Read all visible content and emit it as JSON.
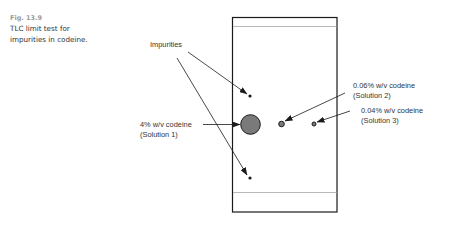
{
  "figure": {
    "number": "Fig. 13.9",
    "caption_lines": [
      "TLC limit test for",
      "impurities in codeine."
    ]
  },
  "diagram": {
    "type": "tlc-plate",
    "colors": {
      "outline": "#1a1a1a",
      "front_line": "#b0b0b0",
      "spot_fill": "#7a7a7a",
      "text": "#333333"
    },
    "labels": {
      "impurities": "Impurities",
      "solution1_line1": "4% w/v codeine",
      "solution1_line2": "(Solution 1)",
      "solution2_line1": "0.06% w/v codeine",
      "solution2_line2": "(Solution 2)",
      "solution3_line1": "0.04% w/v codeine",
      "solution3_line2": "(Solution 3)"
    },
    "spots": [
      {
        "id": "impurity-upper",
        "lane": "Solution 1",
        "description": "impurity spot above main spot"
      },
      {
        "id": "main-solution1",
        "lane": "Solution 1",
        "description": "codeine 4% w/v"
      },
      {
        "id": "impurity-lower",
        "lane": "Solution 1",
        "description": "impurity spot below main spot"
      },
      {
        "id": "solution2",
        "lane": "Solution 2",
        "description": "codeine 0.06% w/v"
      },
      {
        "id": "solution3",
        "lane": "Solution 3",
        "description": "codeine 0.04% w/v"
      }
    ]
  }
}
